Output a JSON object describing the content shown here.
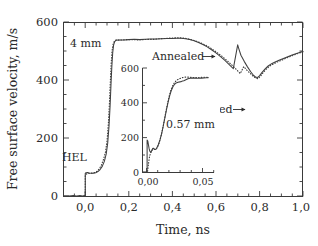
{
  "figure": {
    "title": "",
    "background_color": "#ffffff",
    "curve_color": "#3f3f3f",
    "axis_color": "#3a3a3a"
  },
  "main_axes": {
    "xlabel": "Time, ns",
    "ylabel": "Free surface velocity, m/s",
    "x_ticks": [
      "0,0",
      "0,2",
      "0,4",
      "0,6",
      "0,8",
      "1,0"
    ],
    "x_tick_values": [
      0.0,
      0.2,
      0.4,
      0.6,
      0.8,
      1.0
    ],
    "y_ticks": [
      "0",
      "200",
      "400",
      "600"
    ],
    "y_tick_values": [
      0,
      200,
      400,
      600
    ],
    "xlim": [
      -0.1,
      1.0
    ],
    "ylim": [
      0,
      600
    ]
  },
  "inset_axes": {
    "x_ticks": [
      "0,00",
      "0,05"
    ],
    "x_tick_values": [
      0.0,
      0.05
    ],
    "y_ticks": [
      "0",
      "200",
      "400",
      "600"
    ],
    "y_tick_values": [
      0,
      200,
      400,
      600
    ],
    "xlim": [
      -0.004,
      0.058
    ],
    "ylim": [
      0,
      620
    ]
  },
  "annotations": {
    "main_thickness": "4 mm",
    "inset_thickness": "0.57 mm",
    "hel": "HEL",
    "annealed": "Annealed",
    "rolled": "Rolled",
    "arrow_glyph": "→"
  },
  "chart_data": {
    "type": "line",
    "title": "",
    "xlabel": "Time, ns",
    "ylabel": "Free surface velocity, m/s",
    "xlim": [
      -0.1,
      1.0
    ],
    "ylim": [
      0,
      600
    ],
    "grid": false,
    "legend_position": "inline-annotation",
    "x_tick_labels": [
      "0,0",
      "0,2",
      "0,4",
      "0,6",
      "0,8",
      "1,0"
    ],
    "y_tick_labels": [
      "0",
      "200",
      "400",
      "600"
    ],
    "series": [
      {
        "name": "Annealed",
        "style": "solid",
        "sample": "4 mm",
        "points": [
          [
            -0.1,
            2
          ],
          [
            -0.075,
            2
          ],
          [
            -0.055,
            3
          ],
          [
            -0.04,
            2
          ],
          [
            -0.025,
            3
          ],
          [
            -0.012,
            2
          ],
          [
            -0.004,
            3
          ],
          [
            0.0,
            4
          ],
          [
            0.0,
            80
          ],
          [
            0.004,
            82
          ],
          [
            0.01,
            83
          ],
          [
            0.018,
            81
          ],
          [
            0.028,
            80
          ],
          [
            0.038,
            80
          ],
          [
            0.048,
            82
          ],
          [
            0.058,
            86
          ],
          [
            0.068,
            93
          ],
          [
            0.078,
            104
          ],
          [
            0.088,
            122
          ],
          [
            0.096,
            146
          ],
          [
            0.103,
            184
          ],
          [
            0.109,
            242
          ],
          [
            0.114,
            312
          ],
          [
            0.118,
            384
          ],
          [
            0.122,
            448
          ],
          [
            0.126,
            496
          ],
          [
            0.13,
            522
          ],
          [
            0.135,
            534
          ],
          [
            0.142,
            539
          ],
          [
            0.152,
            540
          ],
          [
            0.165,
            540
          ],
          [
            0.18,
            540
          ],
          [
            0.2,
            541
          ],
          [
            0.225,
            542
          ],
          [
            0.25,
            541
          ],
          [
            0.275,
            542
          ],
          [
            0.3,
            543
          ],
          [
            0.325,
            543
          ],
          [
            0.35,
            544
          ],
          [
            0.375,
            545
          ],
          [
            0.4,
            545
          ],
          [
            0.42,
            546
          ],
          [
            0.44,
            546
          ],
          [
            0.46,
            544
          ],
          [
            0.48,
            541
          ],
          [
            0.5,
            537
          ],
          [
            0.52,
            531
          ],
          [
            0.54,
            524
          ],
          [
            0.56,
            516
          ],
          [
            0.58,
            506
          ],
          [
            0.6,
            495
          ],
          [
            0.62,
            483
          ],
          [
            0.64,
            470
          ],
          [
            0.66,
            456
          ],
          [
            0.68,
            441
          ],
          [
            0.7,
            523
          ],
          [
            0.705,
            510
          ],
          [
            0.715,
            487
          ],
          [
            0.73,
            466
          ],
          [
            0.745,
            447
          ],
          [
            0.76,
            430
          ],
          [
            0.772,
            418
          ],
          [
            0.782,
            412
          ],
          [
            0.79,
            410
          ],
          [
            0.8,
            416
          ],
          [
            0.812,
            428
          ],
          [
            0.826,
            440
          ],
          [
            0.84,
            450
          ],
          [
            0.856,
            458
          ],
          [
            0.872,
            464
          ],
          [
            0.89,
            470
          ],
          [
            0.91,
            476
          ],
          [
            0.93,
            482
          ],
          [
            0.95,
            488
          ],
          [
            0.97,
            493
          ],
          [
            0.985,
            497
          ],
          [
            1.0,
            500
          ]
        ]
      },
      {
        "name": "Rolled",
        "style": "dotted",
        "sample": "4 mm",
        "points": [
          [
            0.0,
            4
          ],
          [
            0.0,
            74
          ],
          [
            0.006,
            78
          ],
          [
            0.014,
            80
          ],
          [
            0.024,
            80
          ],
          [
            0.034,
            81
          ],
          [
            0.044,
            83
          ],
          [
            0.054,
            87
          ],
          [
            0.064,
            95
          ],
          [
            0.074,
            108
          ],
          [
            0.084,
            128
          ],
          [
            0.093,
            154
          ],
          [
            0.1,
            192
          ],
          [
            0.106,
            250
          ],
          [
            0.111,
            322
          ],
          [
            0.115,
            396
          ],
          [
            0.119,
            458
          ],
          [
            0.123,
            502
          ],
          [
            0.128,
            526
          ],
          [
            0.134,
            536
          ],
          [
            0.142,
            540
          ],
          [
            0.155,
            539
          ],
          [
            0.17,
            540
          ],
          [
            0.19,
            541
          ],
          [
            0.215,
            541
          ],
          [
            0.24,
            540
          ],
          [
            0.265,
            541
          ],
          [
            0.29,
            542
          ],
          [
            0.315,
            542
          ],
          [
            0.34,
            544
          ],
          [
            0.365,
            545
          ],
          [
            0.39,
            546
          ],
          [
            0.415,
            547
          ],
          [
            0.435,
            547
          ],
          [
            0.455,
            546
          ],
          [
            0.475,
            543
          ],
          [
            0.495,
            539
          ],
          [
            0.515,
            534
          ],
          [
            0.535,
            528
          ],
          [
            0.555,
            521
          ],
          [
            0.575,
            512
          ],
          [
            0.595,
            502
          ],
          [
            0.615,
            491
          ],
          [
            0.635,
            479
          ],
          [
            0.655,
            466
          ],
          [
            0.675,
            452
          ],
          [
            0.695,
            437
          ],
          [
            0.712,
            424
          ],
          [
            0.728,
            448
          ],
          [
            0.742,
            436
          ],
          [
            0.758,
            424
          ],
          [
            0.772,
            414
          ],
          [
            0.784,
            408
          ],
          [
            0.793,
            406
          ],
          [
            0.804,
            414
          ],
          [
            0.818,
            428
          ],
          [
            0.832,
            440
          ],
          [
            0.848,
            450
          ],
          [
            0.864,
            457
          ],
          [
            0.882,
            464
          ],
          [
            0.902,
            470
          ],
          [
            0.922,
            477
          ],
          [
            0.942,
            483
          ],
          [
            0.962,
            489
          ],
          [
            0.98,
            494
          ],
          [
            1.0,
            499
          ]
        ]
      }
    ],
    "inset": {
      "type": "line",
      "sample": "0.57 mm",
      "xlim": [
        -0.004,
        0.058
      ],
      "ylim": [
        0,
        620
      ],
      "x_tick_labels": [
        "0,00",
        "0,05"
      ],
      "y_tick_labels": [
        "0",
        "200",
        "400",
        "600"
      ],
      "series": [
        {
          "name": "Annealed",
          "style": "solid",
          "points": [
            [
              -0.004,
              3
            ],
            [
              -0.002,
              3
            ],
            [
              -0.0008,
              4
            ],
            [
              0.0,
              6
            ],
            [
              0.0,
              190
            ],
            [
              0.0006,
              184
            ],
            [
              0.0012,
              160
            ],
            [
              0.0018,
              138
            ],
            [
              0.0024,
              124
            ],
            [
              0.003,
              118
            ],
            [
              0.0036,
              122
            ],
            [
              0.0042,
              132
            ],
            [
              0.0048,
              140
            ],
            [
              0.0054,
              142
            ],
            [
              0.006,
              138
            ],
            [
              0.0068,
              134
            ],
            [
              0.0076,
              136
            ],
            [
              0.0086,
              146
            ],
            [
              0.0098,
              164
            ],
            [
              0.0112,
              192
            ],
            [
              0.0126,
              228
            ],
            [
              0.014,
              272
            ],
            [
              0.0154,
              320
            ],
            [
              0.0168,
              368
            ],
            [
              0.0182,
              412
            ],
            [
              0.0196,
              450
            ],
            [
              0.021,
              480
            ],
            [
              0.0224,
              502
            ],
            [
              0.0238,
              516
            ],
            [
              0.0252,
              524
            ],
            [
              0.0268,
              528
            ],
            [
              0.0284,
              530
            ],
            [
              0.03,
              533
            ],
            [
              0.0318,
              537
            ],
            [
              0.0336,
              543
            ],
            [
              0.0354,
              548
            ],
            [
              0.0372,
              551
            ],
            [
              0.0392,
              552
            ],
            [
              0.0412,
              552
            ],
            [
              0.0432,
              551
            ],
            [
              0.0452,
              551
            ],
            [
              0.0472,
              552
            ],
            [
              0.0492,
              553
            ],
            [
              0.0512,
              554
            ],
            [
              0.053,
              555
            ]
          ]
        },
        {
          "name": "Rolled",
          "style": "dotted",
          "points": [
            [
              0.0004,
              8
            ],
            [
              0.001,
              40
            ],
            [
              0.0016,
              72
            ],
            [
              0.0022,
              96
            ],
            [
              0.0028,
              110
            ],
            [
              0.0034,
              118
            ],
            [
              0.004,
              126
            ],
            [
              0.0048,
              134
            ],
            [
              0.0056,
              138
            ],
            [
              0.0064,
              136
            ],
            [
              0.0072,
              134
            ],
            [
              0.0082,
              140
            ],
            [
              0.0094,
              154
            ],
            [
              0.0108,
              180
            ],
            [
              0.0122,
              216
            ],
            [
              0.0136,
              260
            ],
            [
              0.015,
              310
            ],
            [
              0.0164,
              360
            ],
            [
              0.0178,
              406
            ],
            [
              0.0192,
              448
            ],
            [
              0.0206,
              482
            ],
            [
              0.022,
              506
            ],
            [
              0.0234,
              522
            ],
            [
              0.0248,
              534
            ],
            [
              0.0262,
              542
            ],
            [
              0.0278,
              548
            ],
            [
              0.0294,
              552
            ],
            [
              0.0312,
              556
            ],
            [
              0.033,
              558
            ],
            [
              0.035,
              558
            ],
            [
              0.037,
              557
            ],
            [
              0.0392,
              556
            ],
            [
              0.0412,
              555
            ],
            [
              0.0434,
              555
            ],
            [
              0.0456,
              556
            ],
            [
              0.0478,
              556
            ],
            [
              0.05,
              557
            ],
            [
              0.0522,
              557
            ]
          ]
        }
      ]
    }
  }
}
